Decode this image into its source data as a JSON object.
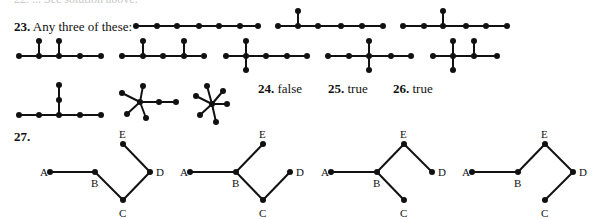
{
  "header_cut": {
    "text": "22. ...      See solution above."
  },
  "problem23": {
    "number": "23.",
    "text": "Any three of these:",
    "graphs": [
      {
        "nodes": [
          [
            136,
            26
          ],
          [
            157,
            26
          ],
          [
            177,
            26
          ],
          [
            199,
            26
          ],
          [
            219,
            26
          ],
          [
            240,
            26
          ],
          [
            258,
            26
          ]
        ],
        "edges": [
          [
            0,
            1
          ],
          [
            1,
            2
          ],
          [
            2,
            3
          ],
          [
            3,
            4
          ],
          [
            4,
            5
          ],
          [
            5,
            6
          ]
        ]
      },
      {
        "nodes": [
          [
            278,
            26
          ],
          [
            298,
            26
          ],
          [
            318,
            26
          ],
          [
            341,
            26
          ],
          [
            362,
            26
          ],
          [
            383,
            26
          ],
          [
            298,
            11
          ]
        ],
        "edges": [
          [
            0,
            1
          ],
          [
            1,
            2
          ],
          [
            2,
            3
          ],
          [
            3,
            4
          ],
          [
            4,
            5
          ],
          [
            1,
            6
          ]
        ]
      },
      {
        "nodes": [
          [
            403,
            26
          ],
          [
            424,
            26
          ],
          [
            443,
            26
          ],
          [
            466,
            26
          ],
          [
            486,
            26
          ],
          [
            507,
            26
          ],
          [
            443,
            11
          ]
        ],
        "edges": [
          [
            0,
            1
          ],
          [
            1,
            2
          ],
          [
            2,
            3
          ],
          [
            3,
            4
          ],
          [
            4,
            5
          ],
          [
            2,
            6
          ]
        ]
      },
      {
        "nodes": [
          [
            19,
            56
          ],
          [
            39,
            56
          ],
          [
            59,
            56
          ],
          [
            80,
            56
          ],
          [
            101,
            56
          ],
          [
            39,
            41
          ],
          [
            59,
            41
          ]
        ],
        "edges": [
          [
            0,
            1
          ],
          [
            1,
            2
          ],
          [
            2,
            3
          ],
          [
            3,
            4
          ],
          [
            1,
            5
          ],
          [
            2,
            6
          ]
        ]
      },
      {
        "nodes": [
          [
            122,
            56
          ],
          [
            143,
            56
          ],
          [
            163,
            56
          ],
          [
            184,
            56
          ],
          [
            204,
            56
          ],
          [
            143,
            41
          ],
          [
            184,
            41
          ]
        ],
        "edges": [
          [
            0,
            1
          ],
          [
            1,
            2
          ],
          [
            2,
            3
          ],
          [
            3,
            4
          ],
          [
            1,
            5
          ],
          [
            3,
            6
          ]
        ]
      },
      {
        "nodes": [
          [
            226,
            56
          ],
          [
            246,
            56
          ],
          [
            266,
            56
          ],
          [
            287,
            56
          ],
          [
            307,
            56
          ],
          [
            246,
            41
          ],
          [
            246,
            70
          ]
        ],
        "edges": [
          [
            0,
            1
          ],
          [
            1,
            2
          ],
          [
            2,
            3
          ],
          [
            3,
            4
          ],
          [
            1,
            5
          ],
          [
            1,
            6
          ]
        ]
      },
      {
        "nodes": [
          [
            328,
            56
          ],
          [
            349,
            56
          ],
          [
            369,
            56
          ],
          [
            391,
            56
          ],
          [
            411,
            56
          ],
          [
            369,
            41
          ],
          [
            369,
            70
          ]
        ],
        "edges": [
          [
            0,
            1
          ],
          [
            1,
            2
          ],
          [
            2,
            3
          ],
          [
            3,
            4
          ],
          [
            2,
            5
          ],
          [
            2,
            6
          ]
        ]
      },
      {
        "nodes": [
          [
            433,
            56
          ],
          [
            453,
            56
          ],
          [
            474,
            56
          ],
          [
            497,
            56
          ],
          [
            453,
            41
          ],
          [
            453,
            70
          ],
          [
            474,
            41
          ]
        ],
        "edges": [
          [
            0,
            1
          ],
          [
            1,
            2
          ],
          [
            2,
            3
          ],
          [
            1,
            4
          ],
          [
            1,
            5
          ],
          [
            2,
            6
          ]
        ]
      },
      {
        "nodes": [
          [
            19,
            115
          ],
          [
            39,
            115
          ],
          [
            59,
            115
          ],
          [
            80,
            115
          ],
          [
            101,
            115
          ],
          [
            59,
            100
          ],
          [
            59,
            85
          ]
        ],
        "edges": [
          [
            0,
            1
          ],
          [
            1,
            2
          ],
          [
            2,
            3
          ],
          [
            3,
            4
          ],
          [
            2,
            5
          ],
          [
            5,
            6
          ]
        ]
      },
      {
        "nodes": [
          [
            140,
            102
          ],
          [
            122,
            93
          ],
          [
            143,
            86
          ],
          [
            127,
            114
          ],
          [
            146,
            118
          ],
          [
            159,
            102
          ],
          [
            176,
            102
          ]
        ],
        "edges": [
          [
            0,
            1
          ],
          [
            0,
            2
          ],
          [
            0,
            3
          ],
          [
            0,
            4
          ],
          [
            0,
            5
          ],
          [
            5,
            6
          ]
        ]
      },
      {
        "nodes": [
          [
            212,
            104
          ],
          [
            196,
            96
          ],
          [
            207,
            86
          ],
          [
            223,
            91
          ],
          [
            227,
            104
          ],
          [
            200,
            115
          ],
          [
            216,
            122
          ]
        ],
        "edges": [
          [
            0,
            1
          ],
          [
            0,
            2
          ],
          [
            0,
            3
          ],
          [
            0,
            4
          ],
          [
            0,
            5
          ],
          [
            0,
            6
          ]
        ]
      }
    ]
  },
  "answers": [
    {
      "number": "24.",
      "value": "false"
    },
    {
      "number": "25.",
      "value": "true"
    },
    {
      "number": "26.",
      "value": "true"
    }
  ],
  "problem27": {
    "number": "27.",
    "trees": [
      {
        "nodes": {
          "A": [
            50,
            172
          ],
          "B": [
            95,
            172
          ],
          "C": [
            123,
            200
          ],
          "D": [
            150,
            172
          ],
          "E": [
            123,
            144
          ]
        },
        "edges": [
          [
            "A",
            "B"
          ],
          [
            "B",
            "C"
          ],
          [
            "C",
            "D"
          ],
          [
            "D",
            "E"
          ]
        ]
      },
      {
        "nodes": {
          "A": [
            190,
            172
          ],
          "B": [
            236,
            172
          ],
          "C": [
            263,
            200
          ],
          "D": [
            290,
            172
          ],
          "E": [
            263,
            144
          ]
        },
        "edges": [
          [
            "A",
            "B"
          ],
          [
            "B",
            "E"
          ],
          [
            "B",
            "C"
          ],
          [
            "C",
            "D"
          ]
        ]
      },
      {
        "nodes": {
          "A": [
            331,
            172
          ],
          "B": [
            377,
            172
          ],
          "C": [
            404,
            200
          ],
          "D": [
            432,
            172
          ],
          "E": [
            404,
            144
          ]
        },
        "edges": [
          [
            "A",
            "B"
          ],
          [
            "B",
            "E"
          ],
          [
            "E",
            "D"
          ],
          [
            "B",
            "C"
          ]
        ]
      },
      {
        "nodes": {
          "A": [
            472,
            172
          ],
          "B": [
            518,
            172
          ],
          "C": [
            545,
            200
          ],
          "D": [
            573,
            172
          ],
          "E": [
            545,
            144
          ]
        },
        "edges": [
          [
            "A",
            "B"
          ],
          [
            "B",
            "E"
          ],
          [
            "E",
            "D"
          ],
          [
            "D",
            "C"
          ]
        ]
      }
    ]
  }
}
